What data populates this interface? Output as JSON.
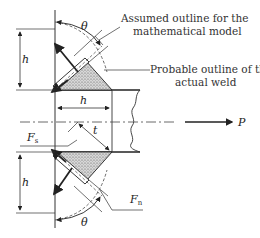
{
  "diagram": {
    "labels": {
      "assumed_line1": "Assumed outline for the",
      "assumed_line2": "mathematical model",
      "probable_line1": "Probable outline of the",
      "probable_line2": "actual weld",
      "h_top": "h",
      "h_mid": "h",
      "h_bottom": "h",
      "theta_top": "θ",
      "theta_bottom": "θ",
      "t": "t",
      "P": "P",
      "Fs": "F",
      "Fs_sub": "s",
      "Fn": "F",
      "Fn_sub": "n"
    },
    "colors": {
      "line": "#222222",
      "fill": "#bdbdbd"
    }
  }
}
